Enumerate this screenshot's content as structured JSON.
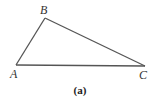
{
  "diagram": {
    "type": "triangle",
    "vertices": [
      {
        "id": "A",
        "label": "A"
      },
      {
        "id": "B",
        "label": "B"
      },
      {
        "id": "C",
        "label": "C"
      }
    ],
    "edges": [
      {
        "from": "A",
        "to": "B"
      },
      {
        "from": "B",
        "to": "C"
      },
      {
        "from": "A",
        "to": "C"
      }
    ],
    "caption": "(a)",
    "line_color": "#555555"
  }
}
